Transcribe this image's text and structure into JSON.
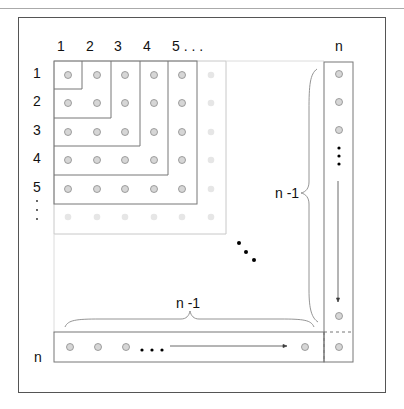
{
  "diagram": {
    "column_labels": [
      "1",
      "2",
      "3",
      "4",
      "5 . . .",
      "n"
    ],
    "row_labels": [
      "1",
      "2",
      "3",
      "4",
      "5",
      ":",
      "n"
    ],
    "brace_labels": {
      "vertical": "n -1",
      "horizontal": "n -1"
    },
    "grid": {
      "dot_rows_dark": 5,
      "dot_cols_dark": 5,
      "faded_ring": 6,
      "right_column_dots_top": 3,
      "right_column_dot_bottom": 1,
      "bottom_row_dots_left": 3,
      "bottom_row_dot_right": 1,
      "corner_dot": 1
    },
    "colors": {
      "frame": "#555555",
      "lines": "#777777",
      "faded_lines": "#c8c8c8",
      "dot_fill": "#d6d6d6",
      "dot_stroke": "#8a8a8a",
      "faded_dot": "#e6e6e6",
      "ellipsis": "#000000"
    }
  }
}
